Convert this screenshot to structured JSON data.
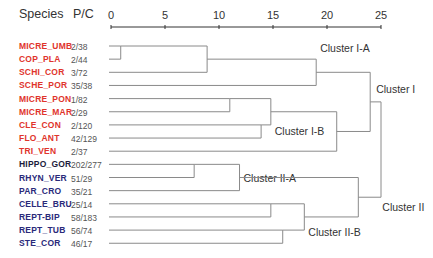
{
  "header": {
    "species_label": "Species",
    "pc_label": "P/C"
  },
  "colors": {
    "cluster_I_label": "#e0342c",
    "cluster_II_label": "#2a2a7a",
    "hippo_label": "#1c1c3c",
    "line": "#8a8a8a",
    "axis": "#333333"
  },
  "chart_data": {
    "type": "dendrogram",
    "title": "",
    "axis": {
      "min": 0,
      "max": 25,
      "ticks": [
        0,
        5,
        10,
        15,
        20,
        25
      ],
      "tick_labels": [
        "0",
        "5",
        "10",
        "15",
        "20",
        "25"
      ]
    },
    "leaves": [
      {
        "name": "MICRE_UMB",
        "pc": "2/38",
        "group": "I"
      },
      {
        "name": "COP_PLA",
        "pc": "2/44",
        "group": "I"
      },
      {
        "name": "SCHI_COR",
        "pc": "3/72",
        "group": "I"
      },
      {
        "name": "SCHE_POR",
        "pc": "35/38",
        "group": "I"
      },
      {
        "name": "MICRE_PON",
        "pc": "1/82",
        "group": "I"
      },
      {
        "name": "MICRE_MAR",
        "pc": "2/29",
        "group": "I"
      },
      {
        "name": "CLE_CON",
        "pc": "2/120",
        "group": "I"
      },
      {
        "name": "FLO_ANT",
        "pc": "42/129",
        "group": "I"
      },
      {
        "name": "TRI_VEN",
        "pc": "2/37",
        "group": "I"
      },
      {
        "name": "HIPPO_GOR",
        "pc": "202/277",
        "group": "II",
        "dark": true
      },
      {
        "name": "RHYN_VER",
        "pc": "51/29",
        "group": "II"
      },
      {
        "name": "PAR_CRO",
        "pc": "35/21",
        "group": "II"
      },
      {
        "name": "CELLE_BRU",
        "pc": "25/14",
        "group": "II"
      },
      {
        "name": "REPT-BIP",
        "pc": "58/183",
        "group": "II"
      },
      {
        "name": "REPT_TUB",
        "pc": "56/74",
        "group": "II"
      },
      {
        "name": "STE_COR",
        "pc": "46/17",
        "group": "II"
      }
    ],
    "merges": [
      {
        "id": "m1",
        "a": 0,
        "b": 1,
        "height": 0.9,
        "out": "top"
      },
      {
        "id": "m2",
        "a": "m1",
        "b": 2,
        "height": 8.9,
        "out": "mid"
      },
      {
        "id": "IA",
        "a": "m2",
        "b": 3,
        "height": 19.0,
        "out": "mid",
        "label": "Cluster I-A"
      },
      {
        "id": "m4",
        "a": 4,
        "b": 5,
        "height": 11.0,
        "out": "top"
      },
      {
        "id": "m5",
        "a": 6,
        "b": 7,
        "height": 13.9,
        "out": "top"
      },
      {
        "id": "m6",
        "a": "m4",
        "b": "m5",
        "height": 14.8,
        "out": "mid"
      },
      {
        "id": "IB",
        "a": "m6",
        "b": 8,
        "height": 20.9,
        "out": "mid",
        "label": "Cluster I-B"
      },
      {
        "id": "I",
        "a": "IA",
        "b": "IB",
        "height": 24.0,
        "out": "mid",
        "label": "Cluster I"
      },
      {
        "id": "m9",
        "a": 9,
        "b": 10,
        "height": 7.7,
        "out": "top"
      },
      {
        "id": "IIA",
        "a": "m9",
        "b": 11,
        "height": 11.9,
        "out": "mid",
        "label": "Cluster II-A"
      },
      {
        "id": "m11",
        "a": 12,
        "b": 13,
        "height": 14.8,
        "out": "top"
      },
      {
        "id": "m12",
        "a": 14,
        "b": 15,
        "height": 15.9,
        "out": "top"
      },
      {
        "id": "IIB",
        "a": "m11",
        "b": "m12",
        "height": 17.9,
        "out": "mid",
        "label": "Cluster II-B"
      },
      {
        "id": "II",
        "a": "IIA",
        "b": "IIB",
        "height": 22.9,
        "out": "mid",
        "label": "Cluster II"
      },
      {
        "id": "root",
        "a": "I",
        "b": "II",
        "height": 25.0,
        "out": "mid"
      }
    ],
    "cluster_labels": [
      "Cluster I-A",
      "Cluster I",
      "Cluster I-B",
      "Cluster II-A",
      "Cluster II",
      "Cluster II-B"
    ]
  }
}
